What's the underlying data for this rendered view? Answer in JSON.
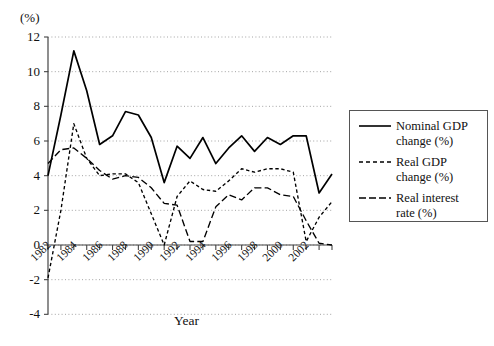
{
  "chart_data": {
    "type": "line",
    "title": "",
    "xlabel": "Year",
    "ylabel": "(%)",
    "ylim": [
      -4,
      12
    ],
    "xlim": [
      1982,
      2004
    ],
    "grid": true,
    "legend_position": "right",
    "yticks": [
      12,
      10,
      8,
      6,
      4,
      2,
      0,
      -2,
      -4
    ],
    "ytick_labels": [
      "12",
      "10",
      "8",
      "6",
      "4",
      "2",
      "0",
      "-2",
      "-4"
    ],
    "xticks": [
      1982,
      1984,
      1986,
      1988,
      1990,
      1992,
      1994,
      1996,
      1998,
      2000,
      2002
    ],
    "xtick_labels": [
      "1982",
      "1984",
      "1986",
      "1988",
      "1990",
      "1992",
      "1994",
      "1996",
      "1998",
      "2000",
      "2002"
    ],
    "x": [
      1982,
      1983,
      1984,
      1985,
      1986,
      1987,
      1988,
      1989,
      1990,
      1991,
      1992,
      1993,
      1994,
      1995,
      1996,
      1997,
      1998,
      1999,
      2000,
      2001,
      2002,
      2003,
      2004
    ],
    "series": [
      {
        "name": "Nominal GDP change (%)",
        "style": "solid",
        "color": "#000000",
        "values": [
          4.0,
          7.5,
          11.2,
          8.9,
          5.8,
          6.3,
          7.7,
          7.5,
          6.2,
          3.6,
          5.7,
          5.0,
          6.2,
          4.7,
          5.6,
          6.3,
          5.4,
          6.2,
          5.8,
          6.3,
          6.3,
          3.0,
          4.1
        ]
      },
      {
        "name": "Real GDP change (%)",
        "style": "dotted",
        "color": "#000000",
        "values": [
          -1.9,
          2.0,
          7.0,
          5.0,
          4.0,
          4.1,
          4.1,
          3.6,
          1.8,
          0.0,
          2.8,
          3.7,
          3.2,
          3.1,
          3.7,
          4.4,
          4.2,
          4.4,
          4.4,
          4.2,
          0.2,
          1.6,
          2.5
        ]
      },
      {
        "name": "Real interest rate (%)",
        "style": "dashed",
        "color": "#000000",
        "values": [
          4.7,
          5.5,
          5.6,
          5.0,
          4.3,
          3.8,
          4.0,
          3.9,
          3.3,
          2.4,
          2.3,
          0.2,
          0.2,
          2.2,
          2.9,
          2.6,
          3.3,
          3.3,
          2.9,
          2.8,
          1.4,
          0.1,
          0.0
        ]
      }
    ]
  },
  "axis": {
    "y_unit_label": "(%)",
    "x_title": "Year"
  },
  "legend": {
    "entries": [
      {
        "label": "Nominal GDP\nchange (%)",
        "style": "solid"
      },
      {
        "label": "Real GDP\nchange (%)",
        "style": "dotted"
      },
      {
        "label": "Real interest\nrate (%)",
        "style": "dashed"
      }
    ]
  }
}
